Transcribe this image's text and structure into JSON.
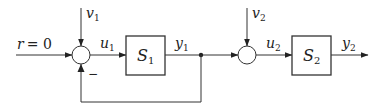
{
  "diagram": {
    "type": "block-diagram",
    "input": {
      "var": "r",
      "eq": "= 0"
    },
    "disturbances": [
      {
        "var": "v",
        "sub": "1"
      },
      {
        "var": "v",
        "sub": "2"
      }
    ],
    "signals": {
      "u1": {
        "var": "u",
        "sub": "1"
      },
      "y1": {
        "var": "y",
        "sub": "1"
      },
      "u2": {
        "var": "u",
        "sub": "2"
      },
      "y2": {
        "var": "y",
        "sub": "2"
      }
    },
    "blocks": [
      {
        "var": "S",
        "sub": "1"
      },
      {
        "var": "S",
        "sub": "2"
      }
    ],
    "feedback_sign": "−",
    "colors": {
      "line": "#333333",
      "background": "#ffffff"
    }
  }
}
